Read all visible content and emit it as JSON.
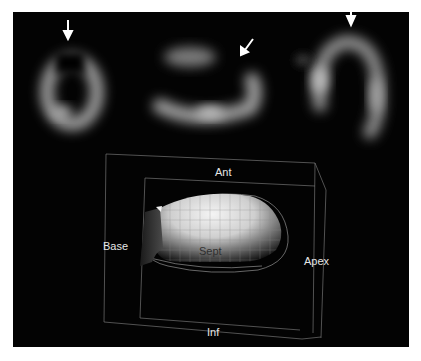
{
  "figure": {
    "top_panel": {
      "slices": [
        {
          "name": "short-axis",
          "arrow_direction": "down"
        },
        {
          "name": "vertical-long-axis",
          "arrow_direction": "down-left"
        },
        {
          "name": "horizontal-long-axis",
          "arrow_direction": "down"
        }
      ]
    },
    "bottom_panel": {
      "labels": {
        "anterior": "Ant",
        "base": "Base",
        "septum": "Sept",
        "apex": "Apex",
        "inferior": "Inf"
      }
    },
    "colors": {
      "background": "#030303",
      "page": "#ffffff",
      "label_light": "#e6e6e6",
      "label_dark": "#303030"
    }
  }
}
